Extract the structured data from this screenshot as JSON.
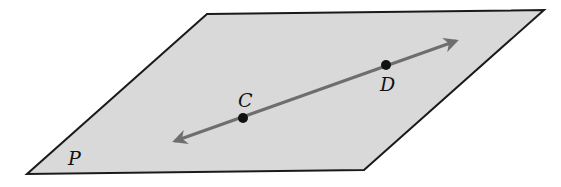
{
  "diagram": {
    "type": "geometry-plane-with-line",
    "plane": {
      "label": "P",
      "vertices": [
        [
          207,
          14
        ],
        [
          544,
          10
        ],
        [
          364,
          170
        ],
        [
          27,
          174
        ]
      ],
      "fill": "#d9d9d9",
      "stroke": "#1a1a1a"
    },
    "line": {
      "start": [
        175,
        141
      ],
      "end": [
        456,
        41
      ],
      "color": "#6e6e6e",
      "arrows": "both"
    },
    "points": [
      {
        "label": "C",
        "x": 243,
        "y": 118
      },
      {
        "label": "D",
        "x": 386,
        "y": 65
      }
    ]
  }
}
